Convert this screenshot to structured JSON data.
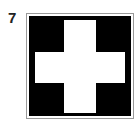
{
  "item": {
    "number": "7",
    "symbol": "white-cross-on-black-square",
    "colors": {
      "background": "#000000",
      "cross": "#ffffff",
      "frame": "#9a9a9a"
    }
  }
}
